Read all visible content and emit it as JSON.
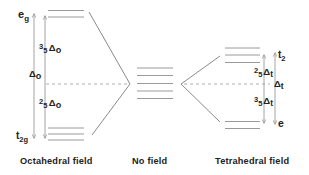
{
  "colors": {
    "background": "#ffffff",
    "lines": "#9a9a9a",
    "text": "#222222"
  },
  "octahedral": {
    "caption": "Octahedral field",
    "upper_set": {
      "main": "e",
      "sub": "g",
      "levels": 2
    },
    "lower_set": {
      "main": "t",
      "sub": "2g",
      "levels": 3
    },
    "total_splitting": {
      "symbol": "Δ",
      "sub": "o"
    },
    "upper_shift": {
      "num": "3",
      "den": "5",
      "symbol": "Δ",
      "sub": "o"
    },
    "lower_shift": {
      "num": "2",
      "den": "5",
      "symbol": "Δ",
      "sub": "o"
    }
  },
  "free_ion": {
    "caption": "No field",
    "levels": 5
  },
  "tetrahedral": {
    "caption": "Tetrahedral field",
    "upper_set": {
      "main": "t",
      "sub": "2",
      "levels": 3
    },
    "lower_set": {
      "main": "e",
      "levels": 2
    },
    "total_splitting": {
      "symbol": "Δ",
      "sub": "t"
    },
    "upper_shift": {
      "num": "2",
      "den": "5",
      "symbol": "Δ",
      "sub": "t"
    },
    "lower_shift": {
      "num": "3",
      "den": "5",
      "symbol": "Δ",
      "sub": "t"
    }
  }
}
